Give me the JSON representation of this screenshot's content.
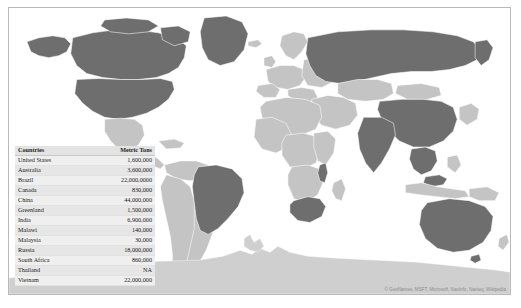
{
  "report": {
    "title": "World Map Report",
    "attribution": "© GeoNames, MSFT, Microsoft, NavInfo, Navteq, Wikipedia"
  },
  "table": {
    "name": "Countries by Metric Tons",
    "columns": [
      "Countries",
      "Metric Tons"
    ],
    "rows": [
      {
        "country": "United States",
        "value": "1,600,000"
      },
      {
        "country": "Australia",
        "value": "3,600,000"
      },
      {
        "country": "Brazil",
        "value": "22,000,0000"
      },
      {
        "country": "Canada",
        "value": "830,000"
      },
      {
        "country": "China",
        "value": "44,000,000"
      },
      {
        "country": "Greenland",
        "value": "1,500,000"
      },
      {
        "country": "India",
        "value": "6,900,000"
      },
      {
        "country": "Malawi",
        "value": "140,000"
      },
      {
        "country": "Malaysia",
        "value": "30,000"
      },
      {
        "country": "Russia",
        "value": "18,000,000"
      },
      {
        "country": "South Africa",
        "value": "860,000"
      },
      {
        "country": "Thailand",
        "value": "NA"
      },
      {
        "country": "Vietnam",
        "value": "22,000,000"
      }
    ]
  },
  "map": {
    "name": "filled-world-map",
    "highlighted_countries": [
      "United States",
      "Canada",
      "Greenland",
      "Brazil",
      "Russia",
      "China",
      "India",
      "Australia",
      "South Africa",
      "Malawi",
      "Malaysia",
      "Vietnam",
      "Thailand"
    ],
    "colors": {
      "highlight": "#6e6e6e",
      "default": "#c4c4c4",
      "antarctica": "#cfcfcf",
      "border": "#ffffff",
      "background": "#ffffff"
    }
  }
}
